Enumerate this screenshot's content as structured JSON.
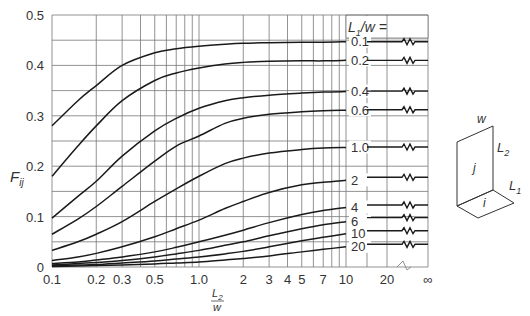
{
  "chart_data": {
    "type": "line",
    "title": "",
    "xlabel": "L2/w",
    "ylabel": "Fij",
    "xscale": "log",
    "xlim": [
      0.1,
      10
    ],
    "extended_x_ticks": [
      "20",
      "∞"
    ],
    "ylim": [
      0,
      0.5
    ],
    "grid": true,
    "y_ticks": [
      "0",
      "0.1",
      "0.2",
      "0.3",
      "0.4",
      "0.5"
    ],
    "x_ticks": [
      "0.1",
      "0.2",
      "0.3",
      "0.5",
      "1.0",
      "2",
      "3",
      "4",
      "5",
      "7",
      "10",
      "20",
      "∞"
    ],
    "legend_title": "L1/w =",
    "x": [
      0.1,
      0.15,
      0.2,
      0.3,
      0.5,
      0.7,
      1.0,
      1.5,
      2,
      3,
      5,
      7,
      10
    ],
    "series": [
      {
        "name": "0.1",
        "values": [
          0.28,
          0.33,
          0.36,
          0.4,
          0.425,
          0.433,
          0.438,
          0.442,
          0.444,
          0.445,
          0.446,
          0.446,
          0.447
        ],
        "asymptote": 0.447
      },
      {
        "name": "0.2",
        "values": [
          0.18,
          0.24,
          0.28,
          0.33,
          0.37,
          0.385,
          0.395,
          0.403,
          0.406,
          0.408,
          0.409,
          0.409,
          0.41
        ],
        "asymptote": 0.41
      },
      {
        "name": "0.4",
        "values": [
          0.097,
          0.14,
          0.17,
          0.22,
          0.27,
          0.295,
          0.315,
          0.33,
          0.336,
          0.341,
          0.345,
          0.347,
          0.348
        ],
        "asymptote": 0.349
      },
      {
        "name": "0.6",
        "values": [
          0.065,
          0.095,
          0.12,
          0.16,
          0.21,
          0.24,
          0.26,
          0.285,
          0.295,
          0.303,
          0.308,
          0.31,
          0.311
        ],
        "asymptote": 0.312
      },
      {
        "name": "1.0",
        "values": [
          0.033,
          0.05,
          0.065,
          0.09,
          0.13,
          0.155,
          0.18,
          0.205,
          0.216,
          0.226,
          0.233,
          0.236,
          0.237
        ],
        "asymptote": 0.238
      },
      {
        "name": "2",
        "values": [
          0.013,
          0.02,
          0.027,
          0.04,
          0.06,
          0.076,
          0.093,
          0.116,
          0.13,
          0.148,
          0.163,
          0.168,
          0.172
        ],
        "asymptote": 0.178
      },
      {
        "name": "4",
        "values": [
          0.007,
          0.01,
          0.014,
          0.02,
          0.03,
          0.039,
          0.05,
          0.063,
          0.073,
          0.088,
          0.104,
          0.112,
          0.118
        ],
        "asymptote": 0.123
      },
      {
        "name": "6",
        "values": [
          0.004,
          0.007,
          0.009,
          0.013,
          0.02,
          0.026,
          0.033,
          0.043,
          0.05,
          0.062,
          0.076,
          0.084,
          0.09
        ],
        "asymptote": 0.098
      },
      {
        "name": "10",
        "values": [
          0.003,
          0.004,
          0.005,
          0.008,
          0.012,
          0.016,
          0.02,
          0.026,
          0.031,
          0.04,
          0.052,
          0.059,
          0.066
        ],
        "asymptote": 0.072
      },
      {
        "name": "20",
        "values": [
          0.001,
          0.002,
          0.003,
          0.004,
          0.006,
          0.008,
          0.01,
          0.014,
          0.017,
          0.022,
          0.03,
          0.035,
          0.04
        ],
        "asymptote": 0.045
      }
    ]
  },
  "axis": {
    "y_label_main": "F",
    "y_label_sub": "ij",
    "x_label_num_main": "L",
    "x_label_num_sub": "2",
    "x_label_den": "w",
    "legend_prefix_main": "L",
    "legend_prefix_sub": "1",
    "legend_suffix": "/w ="
  },
  "diagram": {
    "w_label": "w",
    "j_label": "j",
    "i_label": "i",
    "L2_main": "L",
    "L2_sub": "2",
    "L1_main": "L",
    "L1_sub": "1"
  }
}
